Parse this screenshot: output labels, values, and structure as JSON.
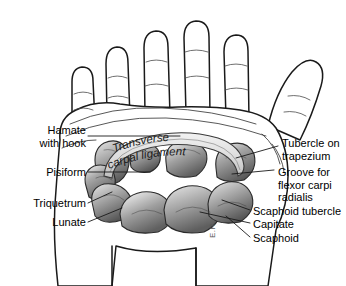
{
  "figure": {
    "background_color": "#ffffff",
    "ink_color": "#1a1a1a",
    "bone_fill_light": "#cfcfcf",
    "bone_fill_mid": "#9a9a9a",
    "bone_fill_dark": "#6a6a6a",
    "ligament_fill": "#d8d8d8",
    "signature": "E.R."
  },
  "labels_left": [
    {
      "id": "hamate-with-hook",
      "lines": [
        "Hamate",
        "with hook"
      ],
      "x": 14,
      "y": 124,
      "width": 72,
      "leader": "dash"
    },
    {
      "id": "pisiform",
      "lines": [
        "Pisiform"
      ],
      "x": 22,
      "y": 166,
      "width": 64,
      "leader": "dash"
    },
    {
      "id": "triquetrum",
      "lines": [
        "Triquetrum"
      ],
      "x": 16,
      "y": 197,
      "width": 70,
      "leader": "dash"
    },
    {
      "id": "lunate",
      "lines": [
        "Lunate"
      ],
      "x": 32,
      "y": 216,
      "width": 54,
      "leader": "dash"
    }
  ],
  "labels_right": [
    {
      "id": "tubercle-on-trapezium",
      "lines": [
        "Tubercle on",
        "trapezium"
      ],
      "x": 282,
      "y": 137,
      "leader": "dash"
    },
    {
      "id": "groove-for-flexor-carpi-radialis",
      "lines": [
        "Groove for",
        "flexor carpi",
        "radialis"
      ],
      "x": 278,
      "y": 166,
      "leader": "dash"
    },
    {
      "id": "scaphoid-tubercle",
      "lines": [
        "Scaphoid tubercle"
      ],
      "x": 253,
      "y": 205,
      "leader": "dash"
    },
    {
      "id": "capitate",
      "lines": [
        "Capitate"
      ],
      "x": 253,
      "y": 218,
      "leader": "dash"
    },
    {
      "id": "scaphoid",
      "lines": [
        "Scaphoid"
      ],
      "x": 253,
      "y": 232,
      "leader": "dash"
    }
  ],
  "ligament_label": {
    "id": "transverse-carpal-ligament",
    "line1": "Transverse",
    "line2": "carpal ligament",
    "style": "italic-curved"
  }
}
